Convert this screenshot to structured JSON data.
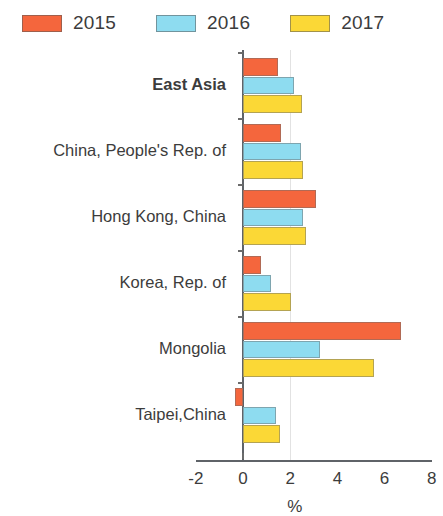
{
  "legend": {
    "position": "top-left",
    "items": [
      {
        "label": "2015",
        "color": "#F4663D"
      },
      {
        "label": "2016",
        "color": "#8EDCF0"
      },
      {
        "label": "2017",
        "color": "#FBD836"
      }
    ]
  },
  "chart_data": {
    "type": "bar",
    "orientation": "horizontal",
    "title": "",
    "subtitle": "",
    "xlabel": "%",
    "ylabel": "",
    "xlim": [
      -2,
      8
    ],
    "xticks": [
      -2,
      0,
      2,
      4,
      6,
      8
    ],
    "xtick_labels": [
      "-2",
      "0",
      "2",
      "4",
      "6",
      "8"
    ],
    "grid": false,
    "categories": [
      "East Asia",
      "China, People's Rep. of",
      "Hong Kong, China",
      "Korea, Rep. of",
      "Mongolia",
      "Taipei,China"
    ],
    "category_styles": [
      "bold",
      "normal",
      "normal",
      "normal",
      "normal",
      "normal"
    ],
    "series": [
      {
        "name": "2015",
        "color": "#F4663D",
        "values": [
          1.5,
          1.6,
          3.1,
          0.75,
          6.7,
          -0.35
        ]
      },
      {
        "name": "2016",
        "color": "#8EDCF0",
        "values": [
          2.15,
          2.45,
          2.55,
          1.2,
          3.25,
          1.4
        ]
      },
      {
        "name": "2017",
        "color": "#FBD836",
        "values": [
          2.5,
          2.55,
          2.65,
          2.05,
          5.55,
          1.55
        ]
      }
    ]
  },
  "axis": {
    "unit_label": "%"
  }
}
